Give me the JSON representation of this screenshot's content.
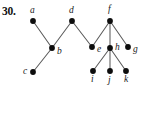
{
  "figure": {
    "problem_number": "30.",
    "width": 142,
    "height": 126,
    "background_color": "#ffffff",
    "edge_color": "#5a5a5a",
    "vertex_color": "#0d0d0d",
    "label_color": "#1a1a1a"
  },
  "graph": {
    "type": "tree",
    "vertex_count": 11,
    "edge_count": 10,
    "vertices": [
      {
        "id": "a",
        "label": "a",
        "x": 33,
        "y": 21,
        "label_x": 30,
        "label_y": 13,
        "label_pos": "above-left"
      },
      {
        "id": "b",
        "label": "b",
        "x": 52,
        "y": 48,
        "label_x": 57,
        "label_y": 54,
        "label_pos": "right"
      },
      {
        "id": "c",
        "label": "c",
        "x": 33,
        "y": 72,
        "label_x": 23,
        "label_y": 74,
        "label_pos": "left"
      },
      {
        "id": "d",
        "label": "d",
        "x": 72,
        "y": 21,
        "label_x": 69,
        "label_y": 13,
        "label_pos": "above"
      },
      {
        "id": "e",
        "label": "e",
        "x": 92,
        "y": 47,
        "label_x": 97,
        "label_y": 52,
        "label_pos": "right"
      },
      {
        "id": "f",
        "label": "f",
        "x": 110,
        "y": 21,
        "label_x": 108,
        "label_y": 12,
        "label_pos": "above"
      },
      {
        "id": "g",
        "label": "g",
        "x": 128,
        "y": 47,
        "label_x": 133,
        "label_y": 52,
        "label_pos": "right"
      },
      {
        "id": "h",
        "label": "h",
        "x": 110,
        "y": 48,
        "label_x": 115,
        "label_y": 50,
        "label_pos": "right"
      },
      {
        "id": "i",
        "label": "i",
        "x": 93,
        "y": 71,
        "label_x": 91,
        "label_y": 82,
        "label_pos": "below"
      },
      {
        "id": "j",
        "label": "j",
        "x": 110,
        "y": 71,
        "label_x": 108,
        "label_y": 83,
        "label_pos": "below"
      },
      {
        "id": "k",
        "label": "k",
        "x": 126,
        "y": 71,
        "label_x": 124,
        "label_y": 82,
        "label_pos": "below"
      }
    ],
    "edges": [
      {
        "from": "a",
        "to": "b"
      },
      {
        "from": "b",
        "to": "c"
      },
      {
        "from": "b",
        "to": "d"
      },
      {
        "from": "d",
        "to": "e"
      },
      {
        "from": "e",
        "to": "f"
      },
      {
        "from": "f",
        "to": "h"
      },
      {
        "from": "f",
        "to": "g"
      },
      {
        "from": "h",
        "to": "i"
      },
      {
        "from": "h",
        "to": "j"
      },
      {
        "from": "h",
        "to": "k"
      }
    ]
  }
}
